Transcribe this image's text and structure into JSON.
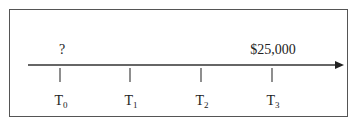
{
  "timeline": {
    "points": [
      {
        "label": "T",
        "sub": "0",
        "x": 60,
        "value": "?"
      },
      {
        "label": "T",
        "sub": "1",
        "x": 130,
        "value": ""
      },
      {
        "label": "T",
        "sub": "2",
        "x": 201,
        "value": ""
      },
      {
        "label": "T",
        "sub": "3",
        "x": 272,
        "value": "$25,000"
      }
    ],
    "line_color": "#333333"
  }
}
